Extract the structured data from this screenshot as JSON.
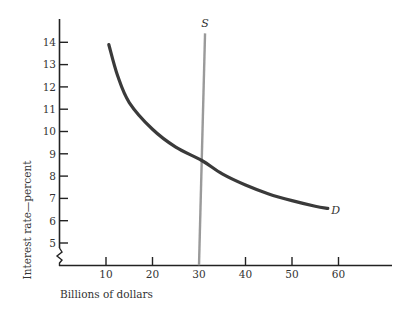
{
  "chart_data": {
    "type": "line",
    "title": "",
    "xlabel": "Billions of dollars",
    "ylabel": "Interest rate—percent",
    "xlim": [
      0,
      70
    ],
    "ylim": [
      4,
      15
    ],
    "x_ticks": [
      10,
      20,
      30,
      40,
      50,
      60
    ],
    "y_ticks": [
      5,
      6,
      7,
      8,
      9,
      10,
      11,
      12,
      13,
      14
    ],
    "y_axis_break": true,
    "grid": false,
    "series": [
      {
        "name": "D",
        "label": "D",
        "color": "#3a3a3a",
        "points": [
          [
            10.6,
            13.9
          ],
          [
            12.5,
            12.5
          ],
          [
            15,
            11.3
          ],
          [
            20,
            10.1
          ],
          [
            25,
            9.3
          ],
          [
            30.6,
            8.7
          ],
          [
            35,
            8.1
          ],
          [
            40,
            7.6
          ],
          [
            45,
            7.2
          ],
          [
            50,
            6.9
          ],
          [
            55,
            6.65
          ],
          [
            57.7,
            6.55
          ]
        ]
      },
      {
        "name": "S",
        "label": "S",
        "color": "#9a9a9a",
        "points": [
          [
            30,
            4
          ],
          [
            31.3,
            14.4
          ]
        ]
      }
    ],
    "annotations": [
      {
        "text": "S",
        "x": 31.3,
        "y": 14.7
      },
      {
        "text": "D",
        "x": 59.3,
        "y": 6.5
      }
    ],
    "intersection": {
      "x": 30.6,
      "y": 8.7
    }
  }
}
